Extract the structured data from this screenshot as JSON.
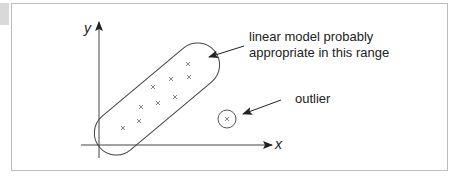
{
  "figure": {
    "axes": {
      "x_label": "x",
      "y_label": "y"
    },
    "annotations": {
      "linear_range_line1": "linear model probably",
      "linear_range_line2": "appropriate in this range",
      "outlier": "outlier"
    },
    "points_in_range": [
      [
        188,
        64
      ],
      [
        189,
        77
      ],
      [
        171,
        79
      ],
      [
        153,
        87
      ],
      [
        175,
        97
      ],
      [
        158,
        103
      ],
      [
        141,
        107
      ],
      [
        139,
        121
      ],
      [
        123,
        128
      ]
    ],
    "outlier_point": [
      227,
      119
    ],
    "colors": {
      "stroke": "#333333",
      "frame": "#bdbdbd",
      "tab": "#d9d9d9"
    }
  }
}
